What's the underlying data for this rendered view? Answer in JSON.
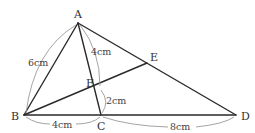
{
  "diagram": {
    "points": {
      "A": {
        "label": "A",
        "x": 78,
        "y": 23
      },
      "B": {
        "label": "B",
        "x": 24,
        "y": 115
      },
      "C": {
        "label": "C",
        "x": 101,
        "y": 115
      },
      "D": {
        "label": "D",
        "x": 236,
        "y": 115
      },
      "E": {
        "label": "E",
        "x": 147,
        "y": 63
      },
      "F": {
        "label": "F",
        "x": 99,
        "y": 88
      }
    },
    "segments": [
      [
        "A",
        "B"
      ],
      [
        "A",
        "C"
      ],
      [
        "A",
        "D"
      ],
      [
        "B",
        "D"
      ],
      [
        "B",
        "E"
      ]
    ],
    "measurements": {
      "AB": "6cm",
      "AF": "4cm",
      "FC": "2cm",
      "BC": "4cm",
      "CD": "8cm"
    },
    "colors": {
      "line": "#2a2a2a",
      "arc": "#9a9a9a",
      "text": "#333333"
    }
  }
}
